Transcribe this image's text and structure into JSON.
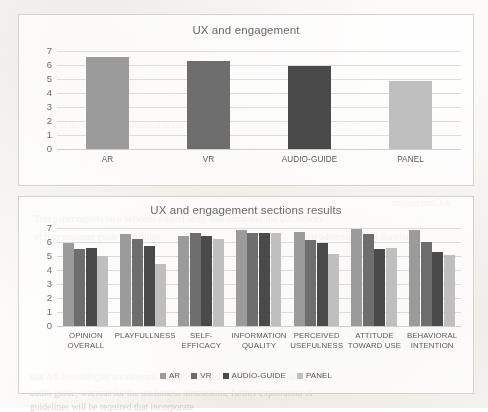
{
  "page": {
    "background_artifacts": [
      {
        "text": "4 Conclusion",
        "x": 392,
        "y": 196,
        "size": 11,
        "mirrored": true
      },
      {
        "text": "to the mean values obtained to engagement",
        "x": 60,
        "y": 120,
        "size": 9,
        "mirrored": false
      },
      {
        "text": "This paper reports on a between subject study that compares the UX indices",
        "x": 34,
        "y": 214,
        "size": 9.5,
        "mirrored": false
      },
      {
        "text": "of four museum guide modalities",
        "x": 34,
        "y": 232,
        "size": 9.5,
        "mirrored": false
      },
      {
        "text": "their advantages and drawbacks",
        "x": 300,
        "y": 232,
        "size": 9.5,
        "mirrored": false
      },
      {
        "text": "that AR technologies are relevant. Results showed that engagement was more",
        "x": 30,
        "y": 372,
        "size": 9.5,
        "mirrored": false
      },
      {
        "text": "audio-guide, whereas for the usefulness dimensions, further exploration of",
        "x": 30,
        "y": 388,
        "size": 9.5,
        "mirrored": false
      },
      {
        "text": "guidelines will be required that incorporate",
        "x": 30,
        "y": 402,
        "size": 9.5,
        "mirrored": false
      }
    ]
  },
  "series_colors": {
    "AR": "#9b9b9b",
    "VR": "#6e6e6e",
    "AUDIO-GUIDE": "#4a4a4a",
    "PANEL": "#bfbfbf"
  },
  "chart_data": [
    {
      "id": "chart-top",
      "type": "bar",
      "title": "UX and engagement",
      "xlabel": "",
      "ylabel": "",
      "ylim": [
        0,
        7
      ],
      "yticks": [
        0,
        1,
        2,
        3,
        4,
        5,
        6,
        7
      ],
      "grid": true,
      "legend": null,
      "categories": [
        "AR",
        "VR",
        "AUDIO-GUIDE",
        "PANEL"
      ],
      "values": [
        6.55,
        6.3,
        5.95,
        4.85
      ],
      "bar_colors": [
        "#9b9b9b",
        "#6e6e6e",
        "#4a4a4a",
        "#bfbfbf"
      ]
    },
    {
      "id": "chart-bottom",
      "type": "bar",
      "title": "UX and engagement sections results",
      "xlabel": "",
      "ylabel": "",
      "ylim": [
        0,
        7
      ],
      "yticks": [
        0,
        1,
        2,
        3,
        4,
        5,
        6,
        7
      ],
      "grid": true,
      "legend_position": "bottom",
      "categories": [
        "OPINION\nOVERALL",
        "PLAYFULLNESS",
        "SELF-EFFICACY",
        "INFORMATION\nQUALITY",
        "PERCEIVED\nUSEFULNESS",
        "ATTITUDE\nTOWARD USE",
        "BEHAVIORAL\nINTENTION"
      ],
      "series": [
        {
          "name": "AR",
          "color": "#9b9b9b",
          "values": [
            5.9,
            6.55,
            6.45,
            6.85,
            6.7,
            6.95,
            6.85
          ]
        },
        {
          "name": "VR",
          "color": "#6e6e6e",
          "values": [
            5.5,
            6.25,
            6.65,
            6.65,
            6.15,
            6.6,
            6.0
          ]
        },
        {
          "name": "AUDIO-GUIDE",
          "color": "#4a4a4a",
          "values": [
            5.6,
            5.7,
            6.4,
            6.65,
            5.95,
            5.5,
            5.3
          ]
        },
        {
          "name": "PANEL",
          "color": "#bfbfbf",
          "values": [
            5.0,
            4.4,
            6.2,
            6.65,
            5.15,
            5.55,
            5.05
          ]
        }
      ]
    }
  ]
}
